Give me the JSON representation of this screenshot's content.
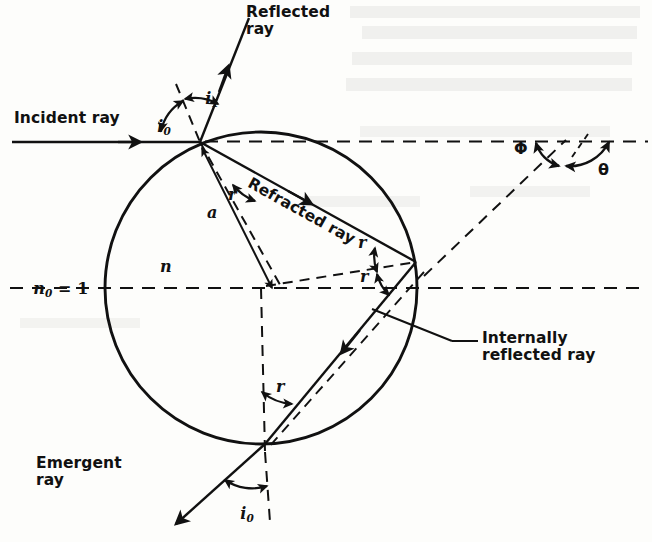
{
  "figure": {
    "title_none": "",
    "type": "optics-ray-diagram",
    "colors": {
      "ink": "#111111",
      "background": "#fdfdfb",
      "ghost": "#c9c9c4"
    },
    "geometry": {
      "circle_center_x": 261,
      "circle_center_y": 288,
      "circle_radius": 156,
      "entry_point": [
        200,
        142
      ],
      "internal_reflection_point": [
        416,
        262
      ],
      "exit_point": [
        265,
        444
      ],
      "axis_y": 288,
      "incident_ray_y": 142,
      "angle_vertex_right": [
        566,
        140
      ]
    },
    "labels": {
      "reflected_ray": "Reflected\nray",
      "incident_ray": "Incident ray",
      "refracted_ray": "Refracted ray",
      "internally_reflected_ray": "Internally\nreflected ray",
      "emergent_ray": "Emergent\nray",
      "refractive_index_outside": "n",
      "refractive_index_outside_sub": "0",
      "refractive_index_outside_eq": " = 1",
      "refractive_index_inside": "n",
      "impact_parameter": "a",
      "angle_i0_top": "i",
      "angle_i0_top_sub": "0",
      "angle_i1": "i",
      "angle_i1_sub": "1",
      "angle_i0_bottom": "i",
      "angle_i0_bottom_sub": "0",
      "angle_r_entry": "r",
      "angle_r_internal_upper": "r",
      "angle_r_internal_lower": "r",
      "angle_r_exit": "r",
      "angle_phi": "Φ",
      "angle_theta": "θ"
    },
    "ghost_text": {
      "line1": "These",
      "line2": "ngle",
      "line3": "point"
    }
  }
}
